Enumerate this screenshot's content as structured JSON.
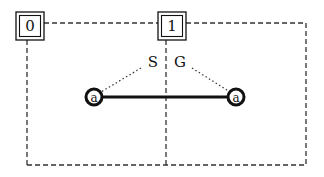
{
  "diagram": {
    "boxes": [
      {
        "id": "box-0",
        "label": "0"
      },
      {
        "id": "box-1",
        "label": "1"
      }
    ],
    "nodes": [
      {
        "id": "node-left",
        "label": "a"
      },
      {
        "id": "node-right",
        "label": "a"
      }
    ],
    "edge_labels": {
      "left": "S",
      "right": "G"
    },
    "colors": {
      "stroke": "#111111",
      "dashed": "#333333",
      "background": "#ffffff"
    }
  }
}
